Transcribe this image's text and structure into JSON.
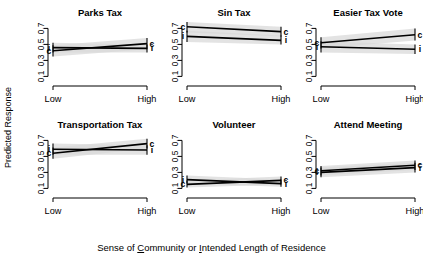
{
  "figure": {
    "ylabel": "Predicted Response",
    "xlabel_parts": {
      "p1": "Sense of ",
      "u1": "C",
      "p2": "ommunity or ",
      "u2": "I",
      "p3": "ntended Length of Residence"
    },
    "xlabel_full": "Sense of Community or Intended Length of Residence"
  },
  "chart_data": {
    "type": "line",
    "title": "",
    "subtitle": "",
    "xlabel": "Sense of Community or Intended Length of Residence",
    "ylabel": "Predicted Response",
    "x": [
      "Low",
      "High"
    ],
    "xticklabels": [
      "Low",
      "High"
    ],
    "yticks": [
      0.1,
      0.3,
      0.5,
      0.7
    ],
    "yticklabels": [
      "0.1",
      "0.3",
      "0.5",
      "0.7"
    ],
    "ylim": [
      0.03,
      0.78
    ],
    "grid": false,
    "legend": "inline point labels",
    "series_names": [
      "c",
      "i"
    ],
    "series_key": {
      "c": "Sense of Community",
      "i": "Intended Length of Residence"
    },
    "layout": {
      "rows": 2,
      "cols": 3
    },
    "panels": [
      {
        "title": "Parks Tax",
        "series": [
          {
            "name": "c",
            "values": [
              0.42,
              0.51
            ],
            "ci_low": [
              0.35,
              0.44
            ],
            "ci_high": [
              0.49,
              0.58
            ]
          },
          {
            "name": "i",
            "values": [
              0.46,
              0.45
            ],
            "ci_low": [
              0.4,
              0.4
            ],
            "ci_high": [
              0.52,
              0.5
            ]
          }
        ]
      },
      {
        "title": "Sin Tax",
        "series": [
          {
            "name": "c",
            "values": [
              0.72,
              0.66
            ],
            "ci_low": [
              0.65,
              0.6
            ],
            "ci_high": [
              0.78,
              0.72
            ]
          },
          {
            "name": "i",
            "values": [
              0.6,
              0.55
            ],
            "ci_low": [
              0.53,
              0.5
            ],
            "ci_high": [
              0.67,
              0.61
            ]
          }
        ]
      },
      {
        "title": "Easier Tax Vote",
        "series": [
          {
            "name": "c",
            "values": [
              0.52,
              0.62
            ],
            "ci_low": [
              0.45,
              0.55
            ],
            "ci_high": [
              0.59,
              0.7
            ]
          },
          {
            "name": "i",
            "values": [
              0.47,
              0.44
            ],
            "ci_low": [
              0.4,
              0.38
            ],
            "ci_high": [
              0.54,
              0.5
            ]
          }
        ]
      },
      {
        "title": "Transportation Tax",
        "series": [
          {
            "name": "c",
            "values": [
              0.54,
              0.66
            ],
            "ci_low": [
              0.47,
              0.6
            ],
            "ci_high": [
              0.61,
              0.72
            ]
          },
          {
            "name": "i",
            "values": [
              0.59,
              0.58
            ],
            "ci_low": [
              0.52,
              0.52
            ],
            "ci_high": [
              0.66,
              0.64
            ]
          }
        ]
      },
      {
        "title": "Volunteer",
        "series": [
          {
            "name": "c",
            "values": [
              0.15,
              0.2
            ],
            "ci_low": [
              0.11,
              0.15
            ],
            "ci_high": [
              0.2,
              0.25
            ]
          },
          {
            "name": "i",
            "values": [
              0.21,
              0.16
            ],
            "ci_low": [
              0.16,
              0.12
            ],
            "ci_high": [
              0.26,
              0.21
            ]
          }
        ]
      },
      {
        "title": "Attend Meeting",
        "series": [
          {
            "name": "c",
            "values": [
              0.32,
              0.39
            ],
            "ci_low": [
              0.26,
              0.33
            ],
            "ci_high": [
              0.38,
              0.45
            ]
          },
          {
            "name": "i",
            "values": [
              0.3,
              0.36
            ],
            "ci_low": [
              0.24,
              0.3
            ],
            "ci_high": [
              0.36,
              0.42
            ]
          }
        ]
      }
    ]
  }
}
